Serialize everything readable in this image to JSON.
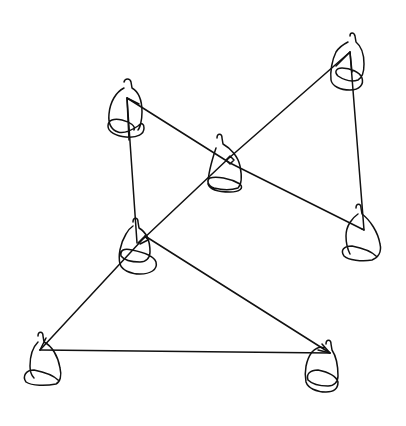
{
  "diagram": {
    "type": "continuous-line drawing",
    "background": "#ffffff",
    "stroke_color": "#111111",
    "figures": [
      {
        "id": "A",
        "label": "seated-figure-upper-left",
        "head": [
          127,
          80
        ],
        "vertex": [
          127,
          98
        ]
      },
      {
        "id": "B",
        "label": "seated-figure-upper-right",
        "head": [
          352,
          32
        ],
        "vertex": [
          350,
          52
        ]
      },
      {
        "id": "C",
        "label": "seated-figure-center",
        "head": [
          219,
          135
        ],
        "vertex": [
          229,
          160
        ]
      },
      {
        "id": "D",
        "label": "seated-figure-middle-left",
        "head": [
          135,
          220
        ],
        "vertex": [
          138,
          243
        ]
      },
      {
        "id": "E",
        "label": "seated-figure-right",
        "head": [
          357,
          205
        ],
        "vertex": [
          364,
          230
        ]
      },
      {
        "id": "F",
        "label": "seated-figure-bottom-left",
        "head": [
          40,
          333
        ],
        "vertex": [
          40,
          350
        ]
      },
      {
        "id": "G",
        "label": "seated-figure-bottom-right",
        "head": [
          327,
          343
        ],
        "vertex": [
          330,
          353
        ]
      }
    ],
    "connections": [
      [
        "A",
        "E"
      ],
      [
        "A",
        "D"
      ],
      [
        "B",
        "E"
      ],
      [
        "B",
        "F"
      ],
      [
        "D",
        "G"
      ],
      [
        "F",
        "G"
      ]
    ]
  }
}
